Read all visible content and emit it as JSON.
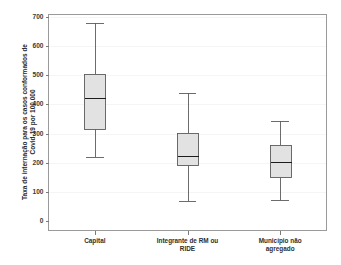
{
  "chart_data": {
    "type": "box",
    "title": "",
    "xlabel": "",
    "ylabel": "Taxa de internação para os casos conformados de Covid-19 por 100.000",
    "ylabel_line1": "Taxa de internação para os casos conformados de",
    "ylabel_line2": "Covid-19 por 100.000",
    "ylim": [
      0,
      700
    ],
    "ytick_values": [
      0,
      100,
      200,
      300,
      400,
      500,
      600,
      700
    ],
    "ytick_labels": [
      "0",
      "100",
      "200",
      "300",
      "400",
      "500",
      "600",
      "700"
    ],
    "grid": false,
    "legend": "none",
    "categories": [
      "Capital",
      "Integrante de RM ou RIDE",
      "Município não agregado"
    ],
    "category_label_lines": [
      [
        "Capital"
      ],
      [
        "Integrante de RM ou",
        "RIDE"
      ],
      [
        "Município não",
        "agregado"
      ]
    ],
    "boxes": [
      {
        "category": "Capital",
        "whisker_low": 220,
        "q1": 315,
        "median": 422,
        "q3": 505,
        "whisker_high": 678
      },
      {
        "category": "Integrante de RM ou RIDE",
        "whisker_low": 68,
        "q1": 192,
        "median": 222,
        "q3": 303,
        "whisker_high": 440
      },
      {
        "category": "Município não agregado",
        "whisker_low": 71,
        "q1": 151,
        "median": 204,
        "q3": 262,
        "whisker_high": 343
      }
    ],
    "colors": {
      "box_fill": "#e2e2e2",
      "box_stroke": "#5c5c5c",
      "median_stroke": "#1c1c1c",
      "axis": "#8f8f8f",
      "text": "#2a2a2a",
      "background": "#ffffff"
    }
  }
}
